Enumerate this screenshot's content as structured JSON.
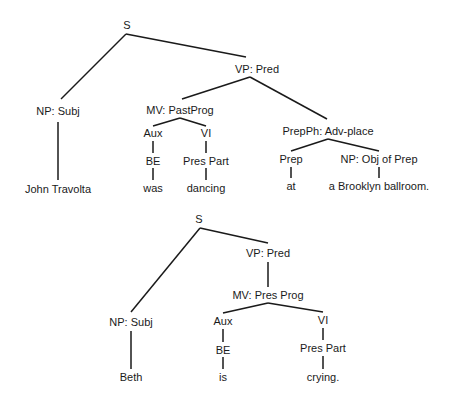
{
  "trees": [
    {
      "name": "tree-john-travolta",
      "nodes": [
        {
          "id": "s",
          "label": "S",
          "x": 127,
          "y": 25
        },
        {
          "id": "np-subj",
          "label": "NP: Subj",
          "x": 58,
          "y": 111
        },
        {
          "id": "vp-pred",
          "label": "VP:  Pred",
          "x": 257,
          "y": 69
        },
        {
          "id": "mv",
          "label": "MV: PastProg",
          "x": 180,
          "y": 110
        },
        {
          "id": "aux",
          "label": "Aux",
          "x": 153,
          "y": 133
        },
        {
          "id": "vi",
          "label": "VI",
          "x": 206,
          "y": 133
        },
        {
          "id": "be",
          "label": "BE",
          "x": 153,
          "y": 161
        },
        {
          "id": "prespart",
          "label": "Pres Part",
          "x": 206,
          "y": 161
        },
        {
          "id": "was",
          "label": "was",
          "x": 153,
          "y": 188
        },
        {
          "id": "dancing",
          "label": "dancing",
          "x": 206,
          "y": 188
        },
        {
          "id": "john",
          "label": "John Travolta",
          "x": 58,
          "y": 189
        },
        {
          "id": "prepph",
          "label": "PrepPh: Adv-place",
          "x": 328,
          "y": 131
        },
        {
          "id": "prep",
          "label": "Prep",
          "x": 291,
          "y": 159
        },
        {
          "id": "np-obj",
          "label": "NP: Obj of Prep",
          "x": 379,
          "y": 159
        },
        {
          "id": "at",
          "label": "at",
          "x": 291,
          "y": 186
        },
        {
          "id": "ballroom",
          "label": "a Brooklyn ballroom.",
          "x": 379,
          "y": 186
        }
      ],
      "edges": [
        [
          126,
          34,
          61,
          99
        ],
        [
          126,
          34,
          246,
          57
        ],
        [
          250,
          77,
          182,
          99
        ],
        [
          250,
          77,
          327,
          119
        ],
        [
          180,
          118,
          153,
          126
        ],
        [
          180,
          118,
          206,
          126
        ],
        [
          153,
          141,
          153,
          153
        ],
        [
          206,
          141,
          206,
          153
        ],
        [
          153,
          168,
          153,
          180
        ],
        [
          206,
          168,
          206,
          180
        ],
        [
          58,
          122,
          58,
          180
        ],
        [
          328,
          139,
          291,
          151
        ],
        [
          328,
          139,
          379,
          151
        ],
        [
          291,
          167,
          291,
          178
        ],
        [
          379,
          167,
          379,
          178
        ]
      ]
    },
    {
      "name": "tree-beth",
      "nodes": [
        {
          "id": "s",
          "label": "S",
          "x": 199,
          "y": 219
        },
        {
          "id": "np-subj",
          "label": "NP: Subj",
          "x": 131,
          "y": 322
        },
        {
          "id": "vp-pred",
          "label": "VP: Pred",
          "x": 268,
          "y": 253
        },
        {
          "id": "mv",
          "label": "MV: Pres Prog",
          "x": 268,
          "y": 295
        },
        {
          "id": "aux",
          "label": "Aux",
          "x": 223,
          "y": 321
        },
        {
          "id": "vi",
          "label": "VI",
          "x": 323,
          "y": 320
        },
        {
          "id": "be",
          "label": "BE",
          "x": 223,
          "y": 350
        },
        {
          "id": "prespart",
          "label": "Pres Part",
          "x": 323,
          "y": 348
        },
        {
          "id": "beth",
          "label": "Beth",
          "x": 131,
          "y": 377
        },
        {
          "id": "is",
          "label": "is",
          "x": 223,
          "y": 377
        },
        {
          "id": "crying",
          "label": "crying.",
          "x": 323,
          "y": 377
        }
      ],
      "edges": [
        [
          200,
          228,
          131,
          312
        ],
        [
          200,
          228,
          268,
          243
        ],
        [
          268,
          262,
          268,
          287
        ],
        [
          268,
          303,
          223,
          313
        ],
        [
          268,
          303,
          323,
          312
        ],
        [
          223,
          329,
          223,
          342
        ],
        [
          323,
          328,
          323,
          340
        ],
        [
          223,
          357,
          223,
          369
        ],
        [
          323,
          356,
          323,
          369
        ],
        [
          131,
          331,
          131,
          369
        ]
      ]
    }
  ]
}
